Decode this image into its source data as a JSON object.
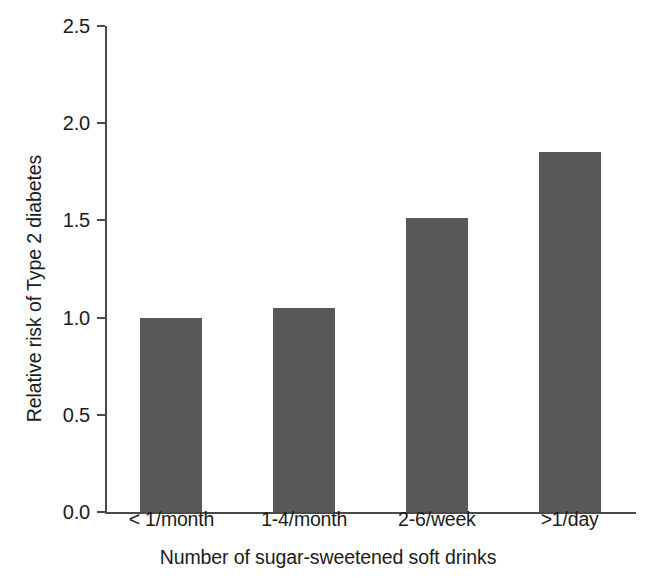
{
  "chart_data": {
    "type": "bar",
    "title": "",
    "subtitle": "",
    "xlabel": "Number of sugar-sweetened soft drinks",
    "ylabel": "Relative risk of Type 2 diabetes",
    "categories": [
      "< 1/month",
      "1-4/month",
      "2-6/week",
      ">1/day"
    ],
    "values": [
      1.0,
      1.05,
      1.51,
      1.85
    ],
    "series": [
      {
        "name": "Relative risk of Type 2 diabetes",
        "values": [
          1.0,
          1.05,
          1.51,
          1.85
        ]
      }
    ],
    "ylim": [
      0.0,
      2.5
    ],
    "yticks": [
      "0.0",
      "0.5",
      "1.0",
      "1.5",
      "2.0",
      "2.5"
    ],
    "ytick_values": [
      0.0,
      0.5,
      1.0,
      1.5,
      2.0,
      2.5
    ],
    "grid": false,
    "legend": false,
    "legend_position": "none",
    "bar_color": "#585858",
    "axis_color": "#4a4a4a",
    "background_color": "#ffffff"
  }
}
